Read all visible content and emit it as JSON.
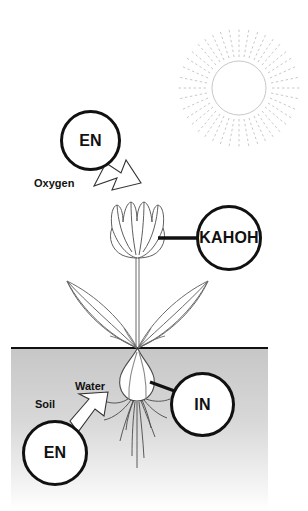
{
  "diagram": {
    "background_color": "#ffffff",
    "ink_color": "#111111",
    "soil_color_top": "#c9c9c9",
    "soil_color_bottom": "#ffffff",
    "sun_color": "#c8c8c8",
    "plant_color": "#555555"
  },
  "nodes": [
    {
      "id": "en-top",
      "label": "EN",
      "font_size": 12
    },
    {
      "id": "kahoh",
      "label": "KAHOH",
      "font_size": 12
    },
    {
      "id": "in",
      "label": "IN",
      "font_size": 12
    },
    {
      "id": "en-soil",
      "label": "EN",
      "font_size": 12
    }
  ],
  "flow_labels": [
    {
      "id": "oxygen",
      "label": "Oxygen",
      "font_size": 11
    },
    {
      "id": "water",
      "label": "Water",
      "font_size": 11
    },
    {
      "id": "soil",
      "label": "Soil",
      "font_size": 11
    }
  ],
  "icons": {
    "sun": "sun-icon",
    "flower": "tulip-flower-icon",
    "leaves": "leaves-icon",
    "bulb": "bulb-icon",
    "roots": "roots-icon",
    "arrow_oxygen": "block-arrow-down-right-icon",
    "arrow_water": "block-arrow-up-right-icon",
    "ground": "ground-line-icon"
  }
}
